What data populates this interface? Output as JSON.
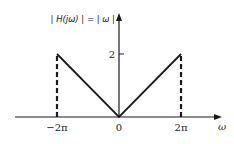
{
  "chart_data": {
    "type": "line",
    "title": "| H(jω) | = | ω |",
    "xlabel": "ω",
    "ylabel": "",
    "x_ticks": [
      {
        "value": -6.283185,
        "label": "−2π"
      },
      {
        "value": 0,
        "label": "0"
      },
      {
        "value": 6.283185,
        "label": "2π"
      }
    ],
    "y_ticks": [
      {
        "value": 2,
        "label": "2"
      }
    ],
    "series": [
      {
        "name": "|H(jω)|",
        "style": "solid",
        "points": [
          [
            -6.283185,
            2
          ],
          [
            0,
            0
          ],
          [
            6.283185,
            2
          ]
        ]
      },
      {
        "name": "cutoff-left",
        "style": "dashed",
        "points": [
          [
            -6.283185,
            0
          ],
          [
            -6.283185,
            2
          ]
        ]
      },
      {
        "name": "cutoff-right",
        "style": "dashed",
        "points": [
          [
            6.283185,
            0
          ],
          [
            6.283185,
            2
          ]
        ]
      }
    ],
    "xlim": [
      -10.5,
      10.2
    ],
    "ylim": [
      0,
      3.3
    ],
    "grid": false,
    "colors": {
      "line": "#1a1a1a",
      "axis": "#1a1a1a"
    }
  }
}
